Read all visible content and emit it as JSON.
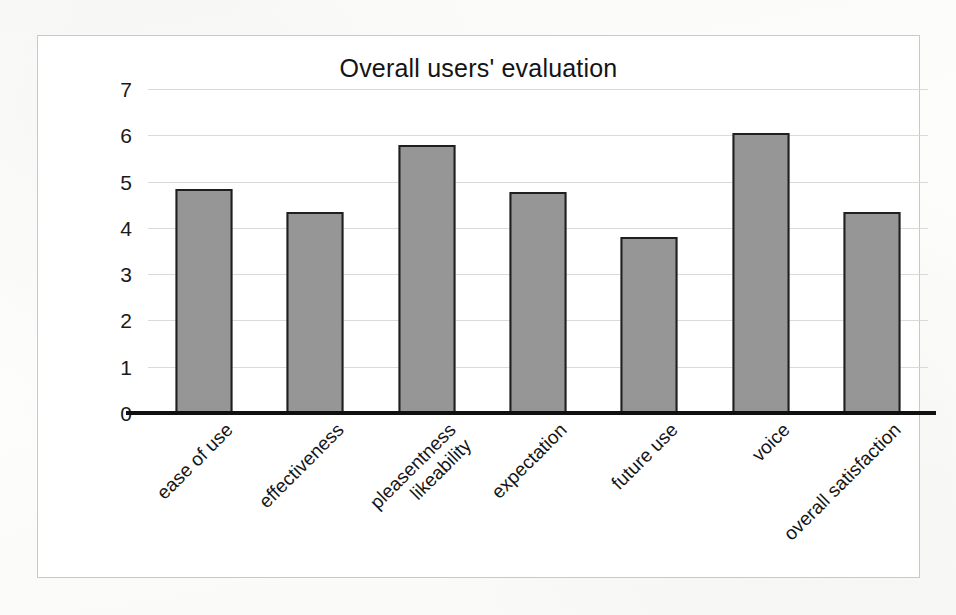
{
  "chart_data": {
    "type": "bar",
    "title": "Overall users' evaluation",
    "xlabel": "",
    "ylabel": "",
    "ylim": [
      0,
      7
    ],
    "ytick_labels": [
      "7",
      "6",
      "5",
      "4",
      "3",
      "2",
      "1",
      "0"
    ],
    "ytick_values": [
      7,
      6,
      5,
      4,
      3,
      2,
      1,
      0
    ],
    "grid": true,
    "legend": "none",
    "bar_color": "#969696",
    "bar_border_color": "#1f1f1f",
    "axis_color": "#101010",
    "gridline_color": "#d8d8d8",
    "frame_color": "#c9c9c9",
    "categories": [
      "ease of use",
      "effectiveness",
      "pleasentness likeability",
      "expectation",
      "future use",
      "voice",
      "overall satisfaction"
    ],
    "category_lines": [
      [
        "ease of use"
      ],
      [
        "effectiveness"
      ],
      [
        "pleasentness",
        "likeability"
      ],
      [
        "expectation"
      ],
      [
        "future use"
      ],
      [
        "voice"
      ],
      [
        "overall satisfaction"
      ]
    ],
    "values": [
      4.85,
      4.35,
      5.8,
      4.78,
      3.8,
      6.05,
      4.35
    ]
  }
}
